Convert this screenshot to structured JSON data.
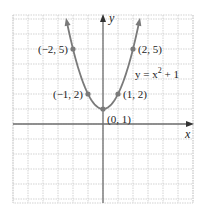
{
  "chart_data": {
    "type": "line",
    "title": "",
    "equation_label": "y = x² + 1",
    "equation": {
      "lhs": "y = x",
      "exponent": "2",
      "rhs": " + 1"
    },
    "xlabel": "x",
    "ylabel": "y",
    "xlim": [
      -6,
      6
    ],
    "ylim": [
      -5.3,
      7.3
    ],
    "grid": true,
    "grid_step": 1,
    "tick_labels_shown": false,
    "series": [
      {
        "name": "y = x^2 + 1",
        "function": "x^2 + 1",
        "x_range": [
          -2.4,
          2.4
        ],
        "arrows_both_ends": true,
        "color": "#7a7a7a"
      }
    ],
    "points": [
      {
        "x": -2,
        "y": 5,
        "label": "(−2, 5)"
      },
      {
        "x": -1,
        "y": 2,
        "label": "(−1, 2)"
      },
      {
        "x": 0,
        "y": 1,
        "label": "(0, 1)"
      },
      {
        "x": 1,
        "y": 2,
        "label": "(1, 2)"
      },
      {
        "x": 2,
        "y": 5,
        "label": "(2, 5)"
      }
    ],
    "colors": {
      "curve": "#7a7a7a",
      "axis": "#6e6e6e",
      "grid": "#c8c8c8",
      "point": "#7a7a7a"
    }
  }
}
